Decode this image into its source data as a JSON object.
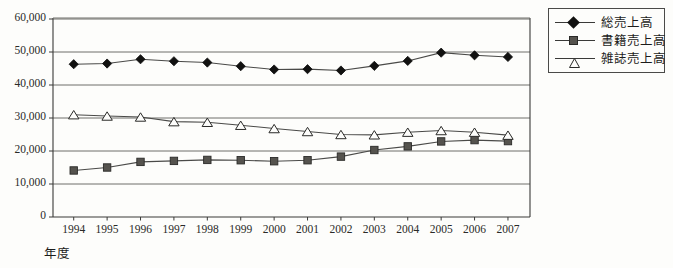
{
  "chart_data": {
    "type": "line",
    "title": "",
    "xlabel": "年度",
    "ylabel": "",
    "grid": true,
    "legend_position": "right",
    "ylim": [
      0,
      60000
    ],
    "ytick_labels": [
      "60,000",
      "50,000",
      "40,000",
      "30,000",
      "20,000",
      "10,000",
      "0"
    ],
    "ytick_values": [
      60000,
      50000,
      40000,
      30000,
      20000,
      10000,
      0
    ],
    "categories": [
      1994,
      1995,
      1996,
      1997,
      1998,
      1999,
      2000,
      2001,
      2002,
      2003,
      2004,
      2005,
      2006,
      2007
    ],
    "xtick_labels": [
      "1994",
      "1995",
      "1996",
      "1997",
      "1998",
      "1999",
      "2000",
      "2001",
      "2002",
      "2003",
      "2004",
      "2005",
      "2006",
      "2007"
    ],
    "series": [
      {
        "name": "総売上高",
        "marker": "filled-diamond",
        "color": "#111110",
        "values": [
          46300,
          46500,
          47800,
          47200,
          46800,
          45700,
          44700,
          44800,
          44400,
          45800,
          47300,
          49800,
          49000,
          48500
        ]
      },
      {
        "name": "書籍売上高",
        "marker": "filled-square",
        "color": "#55534e",
        "values": [
          14100,
          15000,
          16700,
          17000,
          17300,
          17200,
          16900,
          17200,
          18300,
          20300,
          21400,
          22900,
          23300,
          23000
        ]
      },
      {
        "name": "雑誌売上高",
        "marker": "open-triangle",
        "color": "#4a4a48",
        "values": [
          31000,
          30600,
          30300,
          28900,
          28700,
          27800,
          26800,
          25900,
          25000,
          24900,
          25700,
          26200,
          25700,
          24800
        ]
      }
    ]
  },
  "legend": {
    "items": [
      {
        "label": "総売上高",
        "marker": "filled-diamond"
      },
      {
        "label": "書籍売上高",
        "marker": "filled-square"
      },
      {
        "label": "雑誌売上高",
        "marker": "open-triangle"
      }
    ]
  }
}
